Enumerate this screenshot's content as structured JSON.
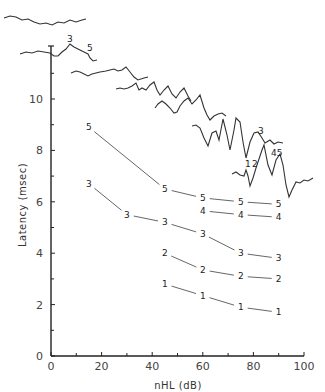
{
  "chart_data": {
    "type": "line",
    "title": "",
    "xlabel": "nHL (dB)",
    "ylabel": "Latency (msec)",
    "xlim": [
      0,
      100
    ],
    "ylim": [
      0,
      12
    ],
    "x_ticks": [
      0,
      20,
      40,
      60,
      80,
      100
    ],
    "x_minor_ticks": [
      10,
      30,
      50,
      70,
      90
    ],
    "y_ticks": [
      0,
      2,
      4,
      6,
      8,
      10
    ],
    "y_minor_ticks": [
      1,
      3,
      5,
      7,
      9,
      11
    ],
    "grid": false,
    "legend": "none (each point marked with its wave number)",
    "series": [
      {
        "name": "Wave V",
        "marker": "5",
        "x": [
          15,
          45,
          60,
          75,
          90
        ],
        "values": [
          8.9,
          6.5,
          6.15,
          6.0,
          5.9
        ]
      },
      {
        "name": "Wave IV",
        "marker": "4",
        "x": [
          60,
          75,
          90
        ],
        "values": [
          5.65,
          5.5,
          5.4
        ]
      },
      {
        "name": "Wave III",
        "marker": "3",
        "x": [
          15,
          30,
          45,
          60,
          75,
          90
        ],
        "values": [
          6.7,
          5.5,
          5.2,
          4.75,
          4.0,
          3.8
        ]
      },
      {
        "name": "Wave II",
        "marker": "2",
        "x": [
          45,
          60,
          75,
          90
        ],
        "values": [
          4.0,
          3.35,
          3.1,
          3.0
        ]
      },
      {
        "name": "Wave I",
        "marker": "1",
        "x": [
          45,
          60,
          75,
          90
        ],
        "values": [
          2.8,
          2.35,
          1.9,
          1.7
        ]
      }
    ],
    "annotations": {
      "waveform_traces": "Stacked ABR waveforms in upper portion, shifted right/down with increasing level",
      "trace_labels": [
        "3",
        "5",
        "1",
        "2",
        "3",
        "4",
        "5"
      ]
    }
  },
  "axes": {
    "x_title": "nHL (dB)",
    "y_title": "Latency (msec)",
    "x_tick_labels": [
      "0",
      "20",
      "40",
      "60",
      "80",
      "100"
    ],
    "y_tick_labels": [
      "0",
      "2",
      "4",
      "6",
      "8",
      "10"
    ]
  },
  "waveform_labels": {
    "top_trace_3": "3",
    "top_trace_5": "5",
    "bottom_trace_1": "1",
    "bottom_trace_2": "2",
    "bottom_trace_3": "3",
    "bottom_trace_45": "45"
  },
  "colors": {
    "ink": "#222222",
    "line": "#555555",
    "background": "#ffffff"
  }
}
